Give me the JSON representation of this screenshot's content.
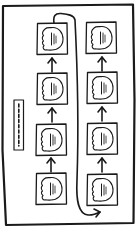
{
  "diagram": {
    "style": "hand-drawn sketch",
    "stroke_color": "#1a1a1a",
    "background": "#ffffff",
    "frame": {
      "label": ""
    },
    "side_panel": {
      "label": "",
      "icon": "vertical-dashed-bar-icon"
    },
    "columns": [
      {
        "name": "left-column",
        "flow": "bottom-to-top",
        "nodes": [
          {
            "label": "",
            "icon": "cloud-document-icon"
          },
          {
            "label": "",
            "icon": "cloud-document-icon"
          },
          {
            "label": "",
            "icon": "cloud-document-icon"
          },
          {
            "label": "",
            "icon": "cloud-document-icon"
          }
        ]
      },
      {
        "name": "right-column",
        "flow": "bottom-to-top",
        "nodes": [
          {
            "label": "",
            "icon": "cloud-document-icon"
          },
          {
            "label": "",
            "icon": "cloud-document-icon"
          },
          {
            "label": "",
            "icon": "cloud-document-icon"
          },
          {
            "label": "",
            "icon": "cloud-document-icon"
          }
        ]
      }
    ],
    "edges": [
      {
        "from": "left-column.node-4",
        "to": "left-column.node-3",
        "type": "arrow-up"
      },
      {
        "from": "left-column.node-3",
        "to": "left-column.node-2",
        "type": "arrow-up"
      },
      {
        "from": "left-column.node-2",
        "to": "left-column.node-1",
        "type": "arrow-up"
      },
      {
        "from": "left-column.node-1",
        "to": "right-column.node-4",
        "type": "curved-connector"
      },
      {
        "from": "right-column.node-4",
        "to": "right-column.node-3",
        "type": "arrow-up"
      },
      {
        "from": "right-column.node-3",
        "to": "right-column.node-2",
        "type": "arrow-up"
      },
      {
        "from": "right-column.node-2",
        "to": "right-column.node-1",
        "type": "arrow-up"
      }
    ]
  }
}
